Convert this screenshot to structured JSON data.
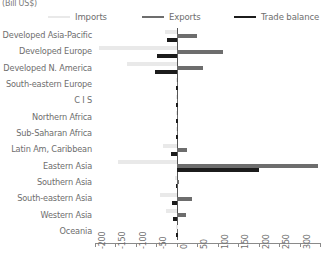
{
  "axis_unit_title": "(Bill US$)",
  "legend": {
    "items": [
      {
        "label": "Imports",
        "color": "#e9e9e9",
        "name": "imports"
      },
      {
        "label": "Exports",
        "color": "#6d6d6d",
        "name": "exports"
      },
      {
        "label": "Trade balance",
        "color": "#1c1c1c",
        "name": "trade-balance"
      }
    ]
  },
  "chart_data": {
    "type": "bar",
    "orientation": "horizontal",
    "title": "",
    "subtitle": "",
    "xlabel": "(Bill US$)",
    "ylabel": "",
    "xlim": [
      -200,
      350
    ],
    "xticks": [
      -200,
      -150,
      -100,
      -50,
      0,
      50,
      100,
      150,
      200,
      250,
      300,
      350
    ],
    "xtick_labels": [
      "-200",
      "-150",
      "-100",
      "-50",
      "0",
      "50",
      "100",
      "150",
      "200",
      "250",
      "300",
      "350"
    ],
    "grid": false,
    "legend_position": "top",
    "categories": [
      "Developed Asia-Pacific",
      "Developed Europe",
      "Developed N. America",
      "South-eastern Europe",
      "C I S",
      "Northern Africa",
      "Sub-Saharan Africa",
      "Latin Am, Caribbean",
      "Eastern Asia",
      "Southern Asia",
      "South-eastern Asia",
      "Western Asia",
      "Oceania"
    ],
    "series": [
      {
        "name": "Imports",
        "color": "#e9e9e9",
        "values": [
          -30,
          -190,
          -122,
          -3,
          -2,
          -2,
          -3,
          -33,
          -145,
          -4,
          -40,
          -27,
          -1
        ]
      },
      {
        "name": "Exports",
        "color": "#6d6d6d",
        "values": [
          49,
          112,
          64,
          3,
          2,
          2,
          3,
          24,
          345,
          5,
          38,
          22,
          1
        ]
      },
      {
        "name": "Trade balance",
        "color": "#1c1c1c",
        "values": [
          -25,
          -48,
          -53,
          -1,
          -1,
          -1,
          -1,
          -15,
          200,
          -2,
          -13,
          -10,
          -1
        ]
      }
    ]
  }
}
